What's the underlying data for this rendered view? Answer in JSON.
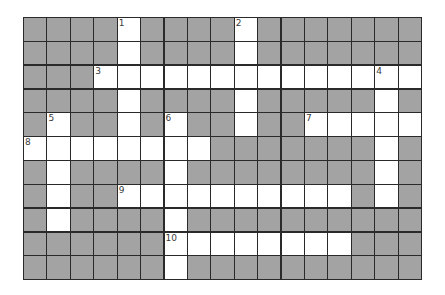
{
  "puzzle": {
    "rows": 11,
    "cols": 17,
    "colors": {
      "block": "#a3a3a3",
      "open": "#ffffff",
      "line": "#2a2a2a",
      "number": "#3a3a3a"
    },
    "white_cells": [
      [
        0,
        4
      ],
      [
        0,
        9
      ],
      [
        1,
        4
      ],
      [
        1,
        9
      ],
      [
        2,
        3
      ],
      [
        2,
        4
      ],
      [
        2,
        5
      ],
      [
        2,
        6
      ],
      [
        2,
        7
      ],
      [
        2,
        8
      ],
      [
        2,
        9
      ],
      [
        2,
        10
      ],
      [
        2,
        11
      ],
      [
        2,
        12
      ],
      [
        2,
        13
      ],
      [
        2,
        14
      ],
      [
        2,
        15
      ],
      [
        2,
        16
      ],
      [
        3,
        4
      ],
      [
        3,
        9
      ],
      [
        3,
        15
      ],
      [
        4,
        1
      ],
      [
        4,
        4
      ],
      [
        4,
        6
      ],
      [
        4,
        9
      ],
      [
        4,
        12
      ],
      [
        4,
        13
      ],
      [
        4,
        14
      ],
      [
        4,
        15
      ],
      [
        4,
        16
      ],
      [
        5,
        0
      ],
      [
        5,
        1
      ],
      [
        5,
        2
      ],
      [
        5,
        3
      ],
      [
        5,
        4
      ],
      [
        5,
        5
      ],
      [
        5,
        6
      ],
      [
        5,
        7
      ],
      [
        5,
        15
      ],
      [
        6,
        1
      ],
      [
        6,
        6
      ],
      [
        6,
        15
      ],
      [
        7,
        1
      ],
      [
        7,
        4
      ],
      [
        7,
        5
      ],
      [
        7,
        6
      ],
      [
        7,
        7
      ],
      [
        7,
        8
      ],
      [
        7,
        9
      ],
      [
        7,
        10
      ],
      [
        7,
        11
      ],
      [
        7,
        12
      ],
      [
        7,
        13
      ],
      [
        7,
        15
      ],
      [
        8,
        1
      ],
      [
        8,
        6
      ],
      [
        9,
        6
      ],
      [
        9,
        7
      ],
      [
        9,
        8
      ],
      [
        9,
        9
      ],
      [
        9,
        10
      ],
      [
        9,
        11
      ],
      [
        9,
        12
      ],
      [
        9,
        13
      ],
      [
        10,
        6
      ]
    ],
    "clue_numbers": [
      {
        "number": "1",
        "row": 0,
        "col": 4
      },
      {
        "number": "2",
        "row": 0,
        "col": 9
      },
      {
        "number": "3",
        "row": 2,
        "col": 3
      },
      {
        "number": "4",
        "row": 2,
        "col": 15
      },
      {
        "number": "5",
        "row": 4,
        "col": 1
      },
      {
        "number": "6",
        "row": 4,
        "col": 6
      },
      {
        "number": "7",
        "row": 4,
        "col": 12
      },
      {
        "number": "8",
        "row": 5,
        "col": 0
      },
      {
        "number": "9",
        "row": 7,
        "col": 4
      },
      {
        "number": "10",
        "row": 9,
        "col": 6
      }
    ]
  }
}
